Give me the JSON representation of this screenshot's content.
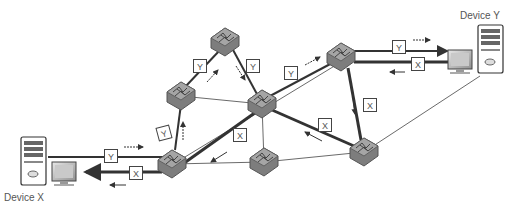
{
  "diagram": {
    "title": "",
    "devices": [
      {
        "id": "device_x",
        "label": "Device X",
        "x": 30,
        "y": 162
      },
      {
        "id": "device_y",
        "label": "Device Y",
        "x": 490,
        "y": 60
      }
    ],
    "switches": [
      {
        "id": "sw_a",
        "x": 172,
        "y": 164
      },
      {
        "id": "sw_b",
        "x": 181,
        "y": 96
      },
      {
        "id": "sw_c",
        "x": 225,
        "y": 42
      },
      {
        "id": "sw_d",
        "x": 262,
        "y": 104
      },
      {
        "id": "sw_e",
        "x": 264,
        "y": 162
      },
      {
        "id": "sw_f",
        "x": 341,
        "y": 57
      },
      {
        "id": "sw_g",
        "x": 364,
        "y": 152
      }
    ],
    "links": [
      {
        "from": "device_x",
        "to": "sw_a",
        "style": "y-path"
      },
      {
        "from": "device_x",
        "to": "sw_a",
        "style": "x-path"
      },
      {
        "from": "sw_a",
        "to": "sw_b",
        "style": "y-path"
      },
      {
        "from": "sw_b",
        "to": "sw_c",
        "style": "y-path"
      },
      {
        "from": "sw_c",
        "to": "sw_d",
        "style": "y-path"
      },
      {
        "from": "sw_d",
        "to": "sw_f",
        "style": "y-path"
      },
      {
        "from": "sw_f",
        "to": "device_y",
        "style": "y-path"
      },
      {
        "from": "device_y",
        "to": "sw_f",
        "style": "x-path"
      },
      {
        "from": "sw_f",
        "to": "sw_g",
        "style": "x-path"
      },
      {
        "from": "sw_g",
        "to": "sw_d",
        "style": "x-path"
      },
      {
        "from": "sw_d",
        "to": "sw_a",
        "style": "x-path"
      },
      {
        "from": "sw_a",
        "to": "sw_d",
        "style": "thick"
      },
      {
        "from": "sw_b",
        "to": "sw_d",
        "style": "thin"
      },
      {
        "from": "sw_d",
        "to": "sw_e",
        "style": "thin"
      },
      {
        "from": "sw_a",
        "to": "sw_e",
        "style": "thin"
      },
      {
        "from": "sw_e",
        "to": "sw_g",
        "style": "thin"
      },
      {
        "from": "sw_a",
        "to": "sw_f",
        "style": "thin"
      },
      {
        "from": "sw_g",
        "to": "device_y",
        "style": "thin"
      }
    ],
    "packets": [
      {
        "label": "Y",
        "x": 104,
        "y": 148
      },
      {
        "label": "X",
        "x": 130,
        "y": 165
      },
      {
        "label": "Y",
        "x": 158,
        "y": 125
      },
      {
        "label": "Y",
        "x": 193,
        "y": 58
      },
      {
        "label": "Y",
        "x": 246,
        "y": 58
      },
      {
        "label": "Y",
        "x": 285,
        "y": 65
      },
      {
        "label": "X",
        "x": 233,
        "y": 127
      },
      {
        "label": "Y",
        "x": 392,
        "y": 40
      },
      {
        "label": "X",
        "x": 411,
        "y": 56
      },
      {
        "label": "X",
        "x": 363,
        "y": 97
      },
      {
        "label": "X",
        "x": 318,
        "y": 117
      }
    ],
    "legend": {
      "packet_y": "Y",
      "packet_x": "X"
    },
    "colors": {
      "line": "#333333",
      "switch_fill": "#8a8a8a",
      "switch_edge": "#555555",
      "label": "#555555"
    }
  }
}
